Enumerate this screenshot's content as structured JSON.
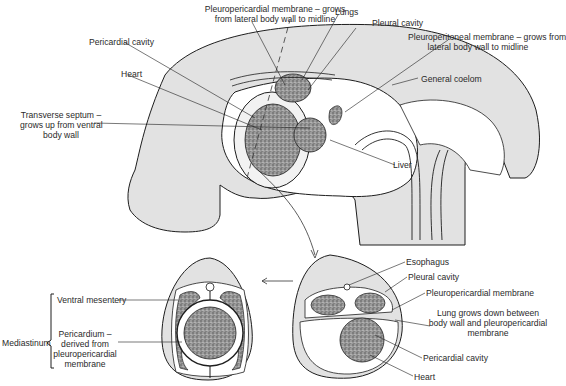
{
  "figure": {
    "top_view": {
      "labels": {
        "pleuropericardial_membrane_1": "Pleuropericardial membrane – grows",
        "pleuropericardial_membrane_2": "from lateral body wall to midline",
        "lungs": "Lungs",
        "pleural_cavity": "Pleural cavity",
        "pleuroperitoneal_membrane_1": "Pleuroperitoneal membrane – grows from",
        "pleuroperitoneal_membrane_2": "lateral body wall to midline",
        "pericardial_cavity": "Pericardial cavity",
        "heart": "Heart",
        "general_coelom": "General coelom",
        "transverse_septum_1": "Transverse septum –",
        "transverse_septum_2": "grows up from ventral",
        "transverse_septum_3": "body wall",
        "liver": "Liver"
      }
    },
    "bottom_left_view": {
      "labels": {
        "mediastinum": "Mediastinum",
        "ventral_mesentery": "Ventral mesentery",
        "pericardium_1": "Pericardium –",
        "pericardium_2": "derived from",
        "pericardium_3": "pleuropericardial",
        "pericardium_4": "membrane"
      }
    },
    "bottom_right_view": {
      "labels": {
        "esophagus": "Esophagus",
        "pleural_cavity": "Pleural cavity",
        "pleuropericardial_membrane": "Pleuropericardial membrane",
        "lung_grows_1": "Lung grows down between",
        "lung_grows_2": "body wall and pleuropericardial",
        "lung_grows_3": "membrane",
        "pericardial_cavity": "Pericardial cavity",
        "heart": "Heart"
      }
    },
    "colors": {
      "body_fill": "#e2e2e2",
      "outline": "#1e1e1e",
      "organ_fill": "#8a8a8a",
      "cavity_fill": "#ffffff"
    }
  }
}
